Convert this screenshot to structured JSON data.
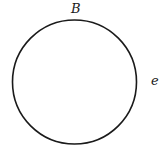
{
  "diagram": {
    "type": "circle",
    "circle": {
      "cx": 74.5,
      "cy": 82,
      "r": 62,
      "stroke": "#1a1a1a",
      "stroke_width": 1.6,
      "fill": "none"
    },
    "labels": {
      "top": "B",
      "right": "e"
    }
  }
}
